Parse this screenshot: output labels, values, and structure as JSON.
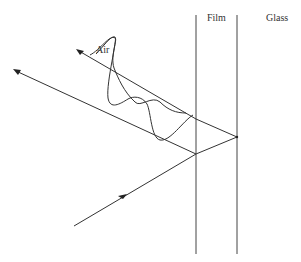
{
  "diagram": {
    "labels": {
      "air": "Air",
      "film": "Film",
      "glass": "Glass"
    },
    "colors": {
      "line": "#333333",
      "background": "#ffffff"
    },
    "elements": {
      "film_boundary_left": {
        "x": 196,
        "y1": 15,
        "y2": 254
      },
      "film_boundary_right": {
        "x": 237,
        "y1": 15,
        "y2": 254
      },
      "incident_ray": {
        "from": [
          74,
          226
        ],
        "to": [
          196,
          154
        ]
      },
      "refracted_ray": {
        "from": [
          196,
          154
        ],
        "to": [
          237,
          137
        ]
      },
      "reflected_in_film": {
        "from": [
          237,
          137
        ],
        "to": [
          196,
          119
        ]
      },
      "reflected_ray_upper": {
        "from": [
          196,
          119
        ],
        "to": [
          77,
          50
        ]
      },
      "reflected_ray_lower": {
        "from": [
          196,
          154
        ],
        "to": [
          14,
          70
        ]
      }
    }
  }
}
